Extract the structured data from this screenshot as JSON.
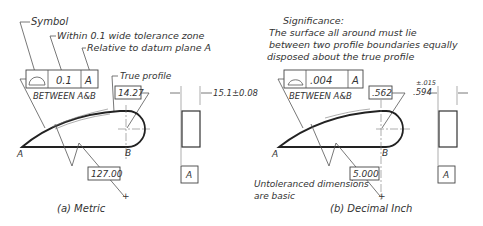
{
  "metric": {
    "caption": "(a) Metric",
    "callouts": {
      "symbol": "Symbol",
      "tolerance_zone": "Within 0.1 wide tolerance zone",
      "datum": "Relative to datum plane A",
      "true_profile": "True profile"
    },
    "feature_control_frame": {
      "symbol": "profile-of-surface",
      "tolerance": "0.1",
      "datum": "A",
      "note": "BETWEEN A&B"
    },
    "dims": {
      "radius_basic": "14.27",
      "length_basic": "127.00",
      "thickness": "15.1±0.08"
    },
    "points": {
      "a": "A",
      "b": "B"
    },
    "datum_label": "A"
  },
  "inch": {
    "caption": "(b) Decimal Inch",
    "significance_title": "Significance:",
    "significance_lines": [
      "The surface all around must lie",
      "between two profile boundaries equally",
      "disposed about the true profile"
    ],
    "feature_control_frame": {
      "symbol": "profile-of-surface",
      "tolerance": ".004",
      "datum": "A",
      "note": "BETWEEN A&B"
    },
    "dims": {
      "radius_basic": ".562",
      "length_basic": "5.000",
      "thickness_tol": "±.015",
      "thickness": ".594"
    },
    "note_lines": [
      "Untoleranced dimensions",
      "are basic"
    ],
    "points": {
      "a": "A",
      "b": "B"
    },
    "datum_label": "A"
  }
}
